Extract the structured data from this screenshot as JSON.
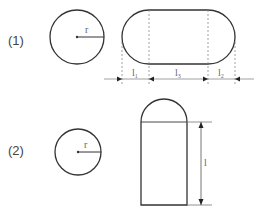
{
  "figure1": {
    "number": "(1)",
    "circle_label": "r",
    "dimensions": [
      {
        "name": "l",
        "sub": "1"
      },
      {
        "name": "l",
        "sub": "3"
      },
      {
        "name": "l",
        "sub": "2"
      }
    ]
  },
  "figure2": {
    "number": "(2)",
    "circle_label": "r",
    "height_label": "l"
  },
  "colors": {
    "stroke": "#333333",
    "dimension": "#777777",
    "text": "#555555"
  }
}
